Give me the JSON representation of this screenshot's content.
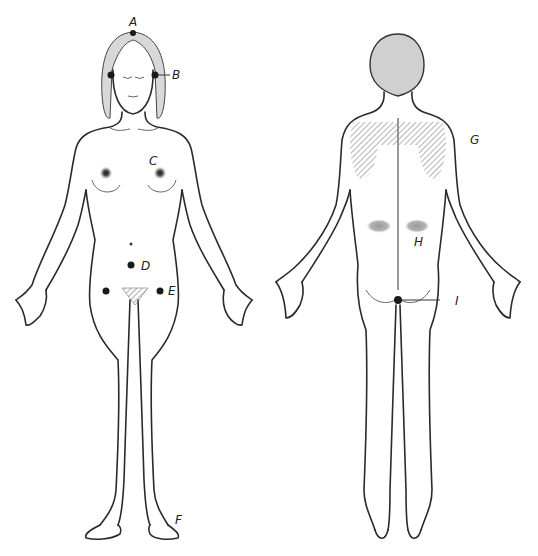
{
  "figure": {
    "type": "anatomical-body-diagram",
    "views": [
      {
        "name": "front",
        "subject": "female figure, anterior view"
      },
      {
        "name": "back",
        "subject": "figure, posterior view"
      }
    ],
    "points": [
      {
        "id": "A",
        "label": "A",
        "location": "crown of head (vertex)",
        "view": "front"
      },
      {
        "id": "B",
        "label": "B",
        "location": "ears",
        "view": "front"
      },
      {
        "id": "C",
        "label": "C",
        "location": "nipples / breasts",
        "view": "front"
      },
      {
        "id": "D",
        "label": "D",
        "location": "below navel (lower abdomen)",
        "view": "front"
      },
      {
        "id": "E",
        "label": "E",
        "location": "groin / either side of pubis",
        "view": "front"
      },
      {
        "id": "F",
        "label": "F",
        "location": "feet / soles",
        "view": "front"
      },
      {
        "id": "G",
        "label": "G",
        "location": "upper back / shoulder blades (shaded)",
        "view": "back"
      },
      {
        "id": "H",
        "label": "H",
        "location": "lower back / kidney area (shaded)",
        "view": "back"
      },
      {
        "id": "I",
        "label": "I",
        "location": "coccyx / base of spine",
        "view": "back"
      }
    ],
    "colors": {
      "line": "#2a2a2a",
      "shade": "#9a9a9a",
      "point": "#1a1a1a",
      "background": "#ffffff"
    }
  }
}
